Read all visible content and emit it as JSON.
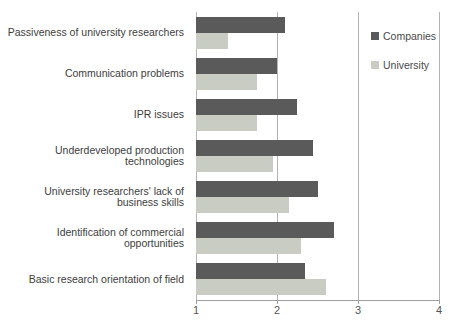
{
  "chart_data": {
    "type": "bar",
    "orientation": "horizontal",
    "title": "",
    "xlabel": "",
    "ylabel": "",
    "categories": [
      "Passiveness of university researchers",
      "Communication problems",
      "IPR issues",
      "Underdeveloped production technologies",
      "University researchers' lack of business skills",
      "Identification of commercial opportunities",
      "Basic research orientation of field"
    ],
    "series": [
      {
        "name": "Companies",
        "color": "#5a5a5a",
        "values": [
          2.1,
          2.0,
          2.25,
          2.45,
          2.5,
          2.7,
          2.35
        ]
      },
      {
        "name": "University",
        "color": "#c8ccc3",
        "values": [
          1.4,
          1.75,
          1.75,
          1.95,
          2.15,
          2.3,
          2.6
        ]
      }
    ],
    "x_axis": {
      "min": 1,
      "max": 4,
      "ticks": [
        "1",
        "2",
        "3",
        "4"
      ]
    },
    "grid": "vertical-gridlines-on",
    "legend_position": "right-top",
    "colors": {
      "gridline": "#b3b3b3",
      "axis_line": "#9f9f9f",
      "label_text": "#3d3d3d",
      "tick_text": "#555555",
      "background": "#ffffff"
    }
  }
}
